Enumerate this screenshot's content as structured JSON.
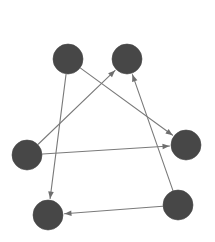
{
  "figure": {
    "type": "directed-graph",
    "title": "",
    "background_color": "#ffffff",
    "width": 215,
    "height": 242
  },
  "style": {
    "node_fill": "#474747",
    "node_stroke": "#474747",
    "node_radius": 15,
    "edge_color": "#7a7a7a",
    "edge_width": 1.1,
    "arrow_color": "#6e6e6e",
    "arrow_size": 7
  },
  "graph": {
    "node_count": 6,
    "edge_count": 6,
    "directed": true,
    "nodes": [
      {
        "id": "A",
        "label": "",
        "name": "node-top-left",
        "x": 68,
        "y": 59
      },
      {
        "id": "B",
        "label": "",
        "name": "node-top-right",
        "x": 127,
        "y": 59
      },
      {
        "id": "C",
        "label": "",
        "name": "node-left",
        "x": 27,
        "y": 155
      },
      {
        "id": "D",
        "label": "",
        "name": "node-right",
        "x": 186,
        "y": 145
      },
      {
        "id": "E",
        "label": "",
        "name": "node-bottom-left",
        "x": 48,
        "y": 215
      },
      {
        "id": "F",
        "label": "",
        "name": "node-bottom-right",
        "x": 178,
        "y": 205
      }
    ],
    "edges": [
      {
        "from": "A",
        "to": "D",
        "name": "edge-top-left-to-right"
      },
      {
        "from": "A",
        "to": "E",
        "name": "edge-top-left-to-bottom-left"
      },
      {
        "from": "C",
        "to": "B",
        "name": "edge-left-to-top-right"
      },
      {
        "from": "C",
        "to": "D",
        "name": "edge-left-to-right"
      },
      {
        "from": "F",
        "to": "B",
        "name": "edge-bottom-right-to-top-right"
      },
      {
        "from": "F",
        "to": "E",
        "name": "edge-bottom-right-to-bottom-left"
      }
    ]
  }
}
